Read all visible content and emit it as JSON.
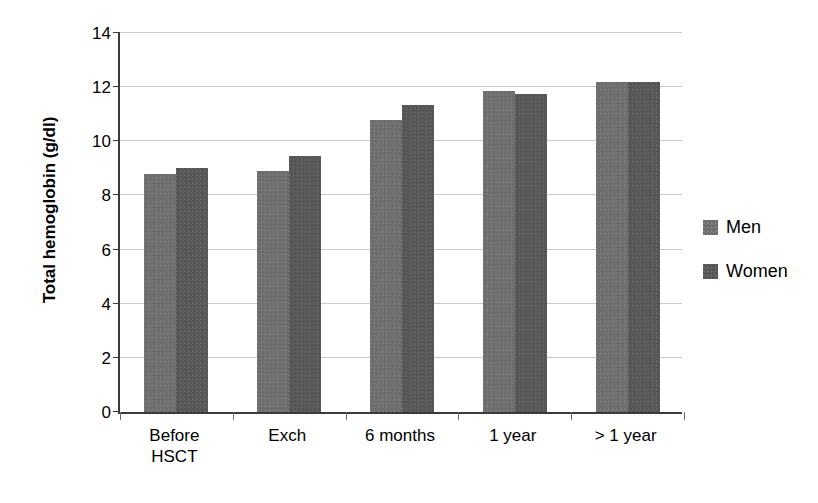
{
  "chart_data": {
    "type": "bar",
    "title": "",
    "xlabel": "",
    "ylabel": "Total hemoglobin (g/dl)",
    "categories": [
      "Before\nHSCT",
      "Exch",
      "6 months",
      "1 year",
      "> 1 year"
    ],
    "series": [
      {
        "name": "Men",
        "color": "#6f6f6f",
        "values": [
          8.8,
          8.9,
          10.8,
          11.85,
          12.2
        ]
      },
      {
        "name": "Women",
        "color": "#575757",
        "values": [
          9.0,
          9.45,
          11.35,
          11.75,
          12.2
        ]
      }
    ],
    "ylim": [
      0,
      14
    ],
    "yticks": [
      0,
      2,
      4,
      6,
      8,
      10,
      12,
      14
    ],
    "ytick_labels": [
      "0",
      "2",
      "4",
      "6",
      "8",
      "10",
      "12",
      "14"
    ],
    "grid": true,
    "legend_position": "right"
  },
  "legend": {
    "items": [
      {
        "label": "Men"
      },
      {
        "label": "Women"
      }
    ]
  }
}
